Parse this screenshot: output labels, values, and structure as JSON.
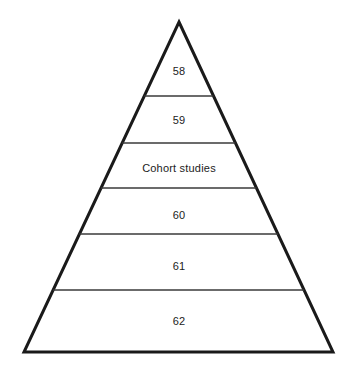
{
  "figure": {
    "kind": "evidence-pyramid",
    "shape": "triangle",
    "background_color": "#ffffff",
    "outline_color": "#1a1a1a",
    "divider_color": "#3a3a3a",
    "text_color": "#1b1b1b",
    "outline_width_px": 3,
    "divider_width_px": 1.6,
    "apex": {
      "x": 179,
      "y": 22
    },
    "base_left": {
      "x": 24,
      "y": 352
    },
    "base_right": {
      "x": 333,
      "y": 352
    },
    "divider_y": [
      96,
      143,
      188,
      234,
      290
    ],
    "tiers": [
      {
        "index": 1,
        "label": "58",
        "label_y": 71
      },
      {
        "index": 2,
        "label": "59",
        "label_y": 120
      },
      {
        "index": 3,
        "label": "Cohort studies",
        "label_y": 168
      },
      {
        "index": 4,
        "label": "60",
        "label_y": 215
      },
      {
        "index": 5,
        "label": "61",
        "label_y": 266
      },
      {
        "index": 6,
        "label": "62",
        "label_y": 321
      }
    ]
  },
  "chart_data": {
    "type": "pyramid",
    "title": "",
    "subtitle": "",
    "xlabel": "",
    "ylabel": "",
    "legend": [],
    "grid": false,
    "orientation": "apex-up",
    "tier_count": 6,
    "categories": [
      "58",
      "59",
      "Cohort studies",
      "60",
      "61",
      "62"
    ],
    "values": [
      1,
      2,
      3,
      4,
      5,
      6
    ],
    "tier_band_bounds_y": [
      [
        22,
        96
      ],
      [
        96,
        143
      ],
      [
        143,
        188
      ],
      [
        188,
        234
      ],
      [
        234,
        290
      ],
      [
        290,
        352
      ]
    ],
    "annotations": [
      "58",
      "59",
      "Cohort studies",
      "60",
      "61",
      "62"
    ]
  }
}
